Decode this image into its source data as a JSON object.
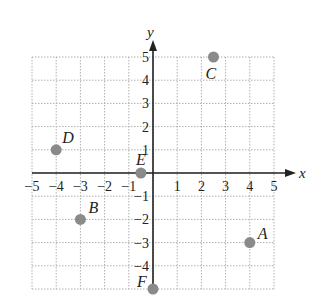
{
  "chart_data": {
    "type": "scatter",
    "title": "",
    "xlabel": "x",
    "ylabel": "y",
    "xlim": [
      -5,
      5
    ],
    "ylim": [
      -5,
      5
    ],
    "grid": true,
    "x_ticks": [
      "-5",
      "-4",
      "-3",
      "-2",
      "-1",
      "1",
      "2",
      "3",
      "4",
      "5"
    ],
    "y_ticks": [
      "5",
      "4",
      "3",
      "2",
      "1",
      "-1",
      "-2",
      "-3",
      "-4"
    ],
    "points": [
      {
        "label": "A",
        "x": 4,
        "y": -3
      },
      {
        "label": "B",
        "x": -3,
        "y": -2
      },
      {
        "label": "C",
        "x": 2.5,
        "y": 5
      },
      {
        "label": "D",
        "x": -4,
        "y": 1
      },
      {
        "label": "E",
        "x": -0.5,
        "y": 0
      },
      {
        "label": "F",
        "x": 0,
        "y": -5
      }
    ],
    "colors": {
      "point": "#8a8a8a",
      "axis": "#222222",
      "grid": "#b0b0b0"
    }
  }
}
